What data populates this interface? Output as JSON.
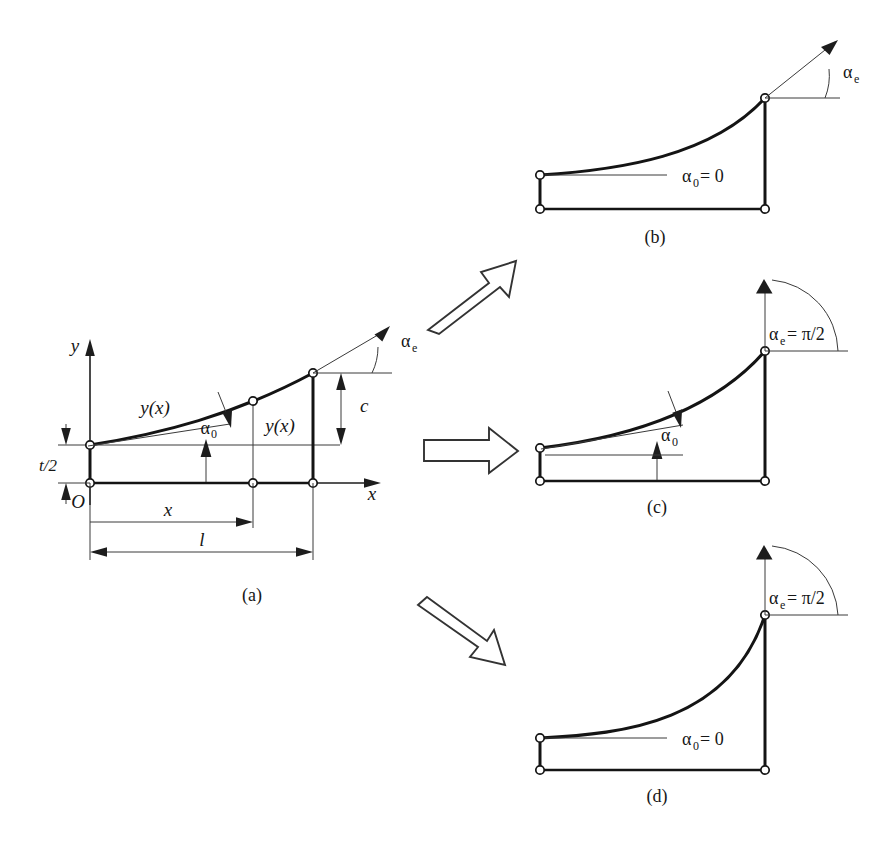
{
  "figure": {
    "background_color": "#ffffff",
    "ink_color": "#161616"
  },
  "panels": [
    {
      "id": "a",
      "caption": "(a)",
      "role": "reference-configuration-with-dimensions",
      "labels": {
        "axis_y": "y",
        "axis_x": "x",
        "origin": "O",
        "thickness": "t/2",
        "curve_left": "y(x)",
        "curve_mid": "y(x)",
        "angle_base": "α",
        "angle_base_sub": "0",
        "angle_end": "α",
        "angle_end_sub": "e",
        "height": "c",
        "dim_x": "x",
        "dim_l": "l"
      }
    },
    {
      "id": "b",
      "caption": "(b)",
      "role": "zero-base-angle-free-end-angle",
      "labels": {
        "angle_base": "α",
        "angle_base_sub": "0",
        "angle_base_value": " = 0",
        "angle_end": "α",
        "angle_end_sub": "e"
      }
    },
    {
      "id": "c",
      "caption": "(c)",
      "role": "nonzero-base-angle-right-angle-end",
      "labels": {
        "angle_base": "α",
        "angle_base_sub": "0",
        "angle_end": "α",
        "angle_end_sub": "e",
        "angle_end_value": " = π/2"
      }
    },
    {
      "id": "d",
      "caption": "(d)",
      "role": "zero-base-angle-right-angle-end",
      "labels": {
        "angle_base": "α",
        "angle_base_sub": "0",
        "angle_base_value": " = 0",
        "angle_end": "α",
        "angle_end_sub": "e",
        "angle_end_value": " = π/2"
      }
    }
  ],
  "connectors": [
    {
      "id": "arrow-a-to-b",
      "direction": "up-right",
      "icon": "block-arrow-icon"
    },
    {
      "id": "arrow-a-to-c",
      "direction": "right",
      "icon": "block-arrow-icon"
    },
    {
      "id": "arrow-a-to-d",
      "direction": "down-right",
      "icon": "block-arrow-icon"
    }
  ]
}
